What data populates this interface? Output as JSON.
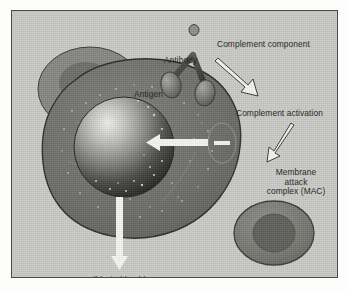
{
  "figure": {
    "type": "biological-illustration",
    "palette": {
      "page_background": "#fdfdfc",
      "panel_background": "#c9c9c6",
      "panel_border": "#4a4a48",
      "cell_body": "#6f6f6d",
      "cell_outline": "#2e2e2d",
      "nucleus_dark": "#2a2a29",
      "nucleus_highlight": "#e6e6e3",
      "antibody": "#4a4a48",
      "arrow_fill": "#f2f2ef",
      "arrow_outline": "#3a3a38",
      "text": "#1d1d1c"
    }
  },
  "labels": {
    "complement_component": "Complement component",
    "antibody": "Antibody",
    "antigen": "Antigen",
    "complement_activation": "Complement activation",
    "membrane_attack_complex": "Membrane attack complex (MAC)",
    "membrane_attack_complex_line1": "Membrane",
    "membrane_attack_complex_line2": "attack",
    "membrane_attack_complex_line3": "complex (MAC)",
    "cell_lysis": "Cell lysis (death)"
  },
  "elements": {
    "target_cell": "large-target-cell",
    "overlapping_cell": "secondary-overlapping-cell",
    "nucleus": "cell-nucleus",
    "small_cell": "small-intact-cell",
    "mac_pore": "membrane-pore",
    "antibody_shape": "y-shaped-antibody",
    "antigen_left": "antigen-oval-left",
    "antigen_right": "antigen-oval-right",
    "complement_knob": "complement-component-knob"
  },
  "arrows": {
    "activation_arrow": "arrow-complement-component-to-activation",
    "mac_arrow": "arrow-activation-to-mac",
    "pore_arrow": "arrow-mac-into-cell",
    "lysis_arrow": "arrow-cell-to-lysis"
  }
}
